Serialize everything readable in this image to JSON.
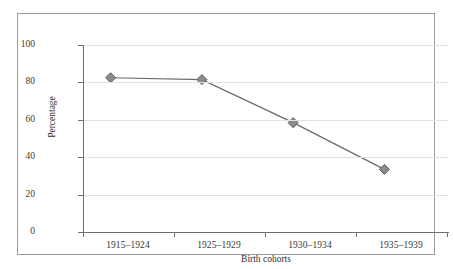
{
  "chart_data": {
    "type": "line",
    "title": "",
    "subtitle": "",
    "xlabel": "Birth cohorts",
    "ylabel": "Percentage",
    "categories": [
      "1915–1924",
      "1925–1929",
      "1930–1934",
      "1935–1939"
    ],
    "values": [
      75,
      74,
      51,
      26
    ],
    "series": [
      {
        "name": "Percentage",
        "values": [
          75,
          74,
          51,
          26
        ]
      }
    ],
    "ylim": [
      0,
      100
    ],
    "yticks": [
      0,
      20,
      40,
      60,
      80,
      100
    ],
    "ytick_labels": [
      "0",
      "20",
      "40",
      "60",
      "80",
      "100"
    ],
    "grid": "horizontal",
    "legend": "none",
    "marker": "diamond",
    "marker_color": "#8c8c8c",
    "marker_edge_color": "#5a5a5a",
    "line_color": "#6a6a6a",
    "grid_color": "#e2e2e2",
    "axis_color": "#6f6f6f",
    "frame_color": "#9a9a9a",
    "text_color": "#2f2f2f",
    "background": "#ffffff"
  }
}
